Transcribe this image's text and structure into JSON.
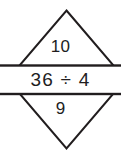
{
  "figure": {
    "type": "math-diamond-problem",
    "colors": {
      "background": "#ffffff",
      "stroke": "#211d1e",
      "band_fill": "#ffffff",
      "text": "#211d1e"
    }
  },
  "diamond": {
    "top_cell": {
      "label": "top-number",
      "value": "10"
    },
    "bottom_cell": {
      "label": "bottom-number",
      "value": "9"
    }
  },
  "band": {
    "label": "expression-band",
    "expression": "36 ÷ 4",
    "operands": [
      36,
      4
    ],
    "operator": "÷",
    "operator_name": "division-sign"
  }
}
